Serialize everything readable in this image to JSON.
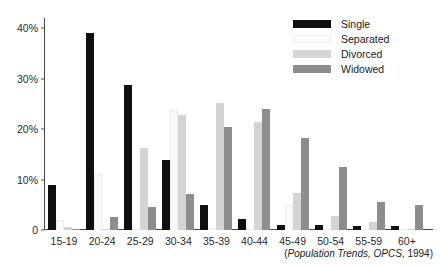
{
  "chart_data": {
    "type": "bar",
    "title": "",
    "subtitle": "",
    "xlabel": "",
    "ylabel": "",
    "ylim": [
      0,
      42
    ],
    "grid": false,
    "legend_position": "top-right",
    "categories": [
      "15-19",
      "20-24",
      "25-29",
      "30-34",
      "35-39",
      "40-44",
      "45-49",
      "50-54",
      "55-59",
      "60+"
    ],
    "ytick_labels": [
      "0",
      "10%",
      "20%",
      "30%",
      "40%"
    ],
    "ytick_values": [
      0,
      10,
      20,
      30,
      40
    ],
    "series": [
      {
        "name": "Single",
        "color": "#100f0f",
        "values": [
          9.0,
          39.0,
          28.8,
          13.8,
          5.0,
          2.2,
          1.0,
          1.0,
          0.7,
          0.8
        ]
      },
      {
        "name": "Separated",
        "color": "#fafafa",
        "values": [
          1.9,
          11.0,
          0.3,
          23.8,
          0.4,
          0.3,
          4.9,
          0.3,
          0.2,
          0.1
        ]
      },
      {
        "name": "Divorced",
        "color": "#d4d4d4",
        "values": [
          0.5,
          0.2,
          16.3,
          22.8,
          25.2,
          21.4,
          7.4,
          2.8,
          1.5,
          0.2
        ]
      },
      {
        "name": "Widowed",
        "color": "#8d8d8d",
        "values": [
          0.1,
          2.6,
          4.5,
          7.2,
          20.5,
          24.0,
          18.3,
          12.5,
          5.6,
          4.9
        ]
      }
    ],
    "annotations": [
      "(Population Trends, OPCS, 1994)"
    ]
  },
  "legend": {
    "items": [
      {
        "label": "Single",
        "swatch": "swatch-single"
      },
      {
        "label": "Separated",
        "swatch": "swatch-separated"
      },
      {
        "label": "Divorced",
        "swatch": "swatch-divorced"
      },
      {
        "label": "Widowed",
        "swatch": "swatch-widowed"
      }
    ]
  },
  "source": {
    "open_paren": "(",
    "italic_part": "Population Trends, OPCS",
    "rest": ", 1994)"
  }
}
